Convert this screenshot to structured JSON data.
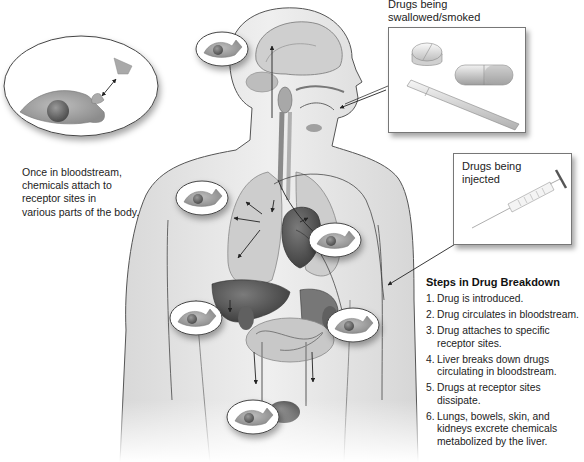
{
  "labels": {
    "swallowed_smoked": [
      "Drugs being",
      "swallowed/smoked"
    ],
    "injected": [
      "Drugs being",
      "injected"
    ],
    "bloodstream_caption": [
      "Once in bloodstream,",
      "chemicals attach to",
      "receptor sites in",
      "various parts of the body."
    ]
  },
  "steps": {
    "title": "Steps in Drug Breakdown",
    "items": [
      {
        "num": "1.",
        "lines": [
          "Drug is introduced."
        ]
      },
      {
        "num": "2.",
        "lines": [
          "Drug circulates in bloodstream."
        ]
      },
      {
        "num": "3.",
        "lines": [
          "Drug attaches to specific",
          "receptor sites."
        ]
      },
      {
        "num": "4.",
        "lines": [
          "Liver breaks down drugs",
          "circulating in bloodstream."
        ]
      },
      {
        "num": "5.",
        "lines": [
          "Drugs at receptor sites",
          "dissipate."
        ]
      },
      {
        "num": "6.",
        "lines": [
          "Lungs, bowels, skin, and",
          "kidneys excrete chemicals",
          "metabolized by the liver."
        ]
      }
    ]
  },
  "illustration": {
    "items": [
      "pill",
      "capsule",
      "cigarette",
      "syringe",
      "receptor cell",
      "drug molecule"
    ],
    "receptor_site_locations": [
      "brain",
      "shoulder-left",
      "heart",
      "hand-left",
      "hand-right",
      "bladder"
    ],
    "colors": {
      "skin": "#e9e9e9",
      "outline": "#4a4a4a",
      "organ_dark": "#555555",
      "organ_mid": "#8a8a8a",
      "organ_light": "#c4c4c4"
    }
  }
}
